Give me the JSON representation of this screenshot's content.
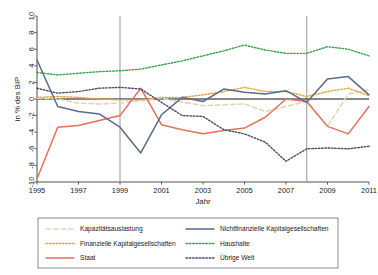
{
  "chart_data": {
    "type": "line",
    "title": "",
    "xlabel": "Jahr",
    "ylabel": "in % des BIP",
    "xlim": [
      1995,
      2011
    ],
    "ylim": [
      -10,
      10
    ],
    "ytick_step": 2,
    "grid": false,
    "legend_position": "bottom",
    "x": [
      1995,
      1996,
      1997,
      1998,
      1999,
      2000,
      2001,
      2002,
      2003,
      2004,
      2005,
      2006,
      2007,
      2008,
      2009,
      2010,
      2011
    ],
    "xticks": [
      "1995",
      "1997",
      "1999",
      "2001",
      "2003",
      "2005",
      "2007",
      "2009",
      "2011"
    ],
    "yticks": [
      "-10",
      "-8",
      "-6",
      "-4",
      "-2",
      "0",
      "2",
      "4",
      "6",
      "8",
      "10"
    ],
    "vlines": [
      1999,
      2008
    ],
    "zero_line": 0,
    "series": [
      {
        "name": "Kapazitätsauslastung",
        "color": "#ded6b8",
        "style": "dashed",
        "width": 1.6,
        "values": [
          0.1,
          0.0,
          -0.5,
          -0.6,
          -0.5,
          -0.2,
          0.1,
          -0.4,
          -0.8,
          -0.7,
          -0.6,
          -1.5,
          -0.9,
          -0.3,
          -3.3,
          0.6,
          1.1
        ]
      },
      {
        "name": "Finanzielle Kapitalgesellschaften",
        "color": "#e8a33d",
        "style": "dotted",
        "width": 1.4,
        "values": [
          0.2,
          0.3,
          0.2,
          0.0,
          -0.1,
          -0.1,
          0.2,
          0.2,
          0.5,
          0.9,
          1.4,
          0.9,
          0.9,
          0.3,
          0.9,
          1.3,
          0.4
        ]
      },
      {
        "name": "Staat",
        "color": "#e8705a",
        "style": "solid",
        "width": 1.5,
        "values": [
          -9.6,
          -3.4,
          -3.2,
          -2.6,
          -2.0,
          1.3,
          -3.1,
          -3.7,
          -4.2,
          -3.8,
          -3.5,
          -2.2,
          0.0,
          -0.3,
          -3.3,
          -4.2,
          -0.9
        ]
      },
      {
        "name": "Nichtfinanzielle Kapitalgesellschaften",
        "color": "#5a6b8c",
        "style": "solid",
        "width": 1.5,
        "values": [
          4.7,
          -0.9,
          -1.5,
          -1.8,
          -3.4,
          -6.5,
          -1.9,
          0.2,
          -0.3,
          1.2,
          0.8,
          0.6,
          1.0,
          -0.4,
          2.4,
          2.7,
          0.5
        ]
      },
      {
        "name": "Haushalte",
        "color": "#3f9e4d",
        "style": "dotted",
        "width": 1.4,
        "values": [
          3.2,
          2.9,
          3.1,
          3.3,
          3.4,
          3.6,
          4.1,
          4.6,
          5.2,
          5.8,
          6.5,
          5.9,
          5.5,
          5.5,
          6.3,
          6.0,
          5.2
        ]
      },
      {
        "name": "Übrige Welt",
        "color": "#4c4a6b",
        "style": "dotted",
        "width": 1.4,
        "values": [
          1.3,
          0.7,
          0.9,
          1.3,
          1.4,
          1.2,
          -0.4,
          -2.0,
          -2.1,
          -3.7,
          -4.2,
          -5.2,
          -7.5,
          -6.0,
          -5.9,
          -6.0,
          -5.7
        ]
      }
    ]
  },
  "legend": {
    "left_column": [
      {
        "label": "Kapazitätsauslastung"
      },
      {
        "label": "Finanzielle Kapitalgesellschaften"
      },
      {
        "label": "Staat"
      }
    ],
    "right_column": [
      {
        "label": "Nichtfinanzielle Kapitalgesellschaften"
      },
      {
        "label": "Haushalte"
      },
      {
        "label": "Übrige Welt"
      }
    ]
  }
}
